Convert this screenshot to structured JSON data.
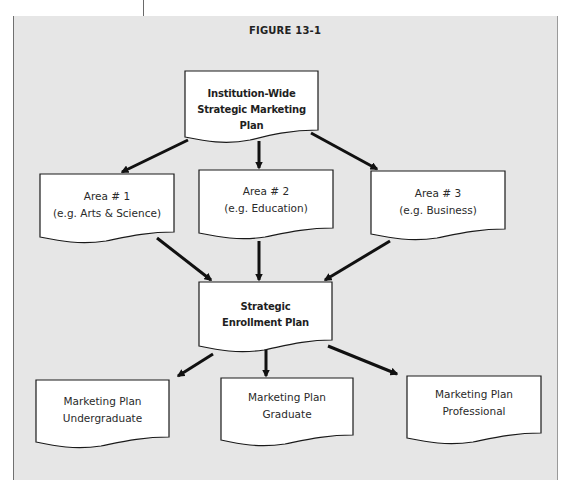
{
  "figure": {
    "title": "FIGURE 13-1"
  },
  "nodes": {
    "top": {
      "line1": "Institution-Wide",
      "line2": "Strategic Marketing Plan"
    },
    "area1": {
      "line1": "Area # 1",
      "line2": "(e.g. Arts & Science)"
    },
    "area2": {
      "line1": "Area # 2",
      "line2": "(e.g. Education)"
    },
    "area3": {
      "line1": "Area # 3",
      "line2": "(e.g. Business)"
    },
    "center": {
      "line1": "Strategic",
      "line2": "Enrollment Plan"
    },
    "undergrad": {
      "line1": "Marketing Plan",
      "line2": "Undergraduate"
    },
    "graduate": {
      "line1": "Marketing Plan",
      "line2": "Graduate"
    },
    "professional": {
      "line1": "Marketing Plan",
      "line2": "Professional"
    }
  },
  "edges": [
    {
      "from": "top",
      "to": "area1"
    },
    {
      "from": "top",
      "to": "area2"
    },
    {
      "from": "top",
      "to": "area3"
    },
    {
      "from": "area1",
      "to": "center"
    },
    {
      "from": "area2",
      "to": "center"
    },
    {
      "from": "area3",
      "to": "center"
    },
    {
      "from": "center",
      "to": "undergrad"
    },
    {
      "from": "center",
      "to": "graduate"
    },
    {
      "from": "center",
      "to": "professional"
    }
  ],
  "colors": {
    "background": "#e6e6e6",
    "box_fill": "#ffffff",
    "stroke": "#1a1a1a"
  }
}
